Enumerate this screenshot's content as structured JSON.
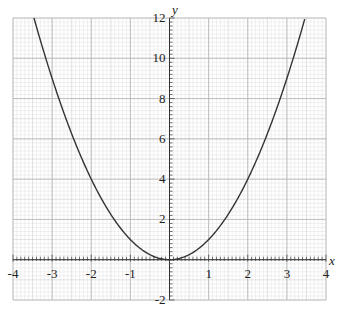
{
  "chart_data": {
    "type": "line",
    "title": "",
    "xlabel": "x",
    "ylabel": "y",
    "xlim": [
      -4,
      4
    ],
    "ylim": [
      -2,
      12
    ],
    "grid": true,
    "x_ticks": [
      -4,
      -3,
      -2,
      -1,
      1,
      2,
      3,
      4
    ],
    "y_ticks": [
      -2,
      2,
      4,
      6,
      8,
      10,
      12
    ],
    "series": [
      {
        "name": "y = x^2",
        "function": "x^2",
        "x": [
          -3.46,
          -3,
          -2.5,
          -2,
          -1.5,
          -1,
          -0.5,
          0,
          0.5,
          1,
          1.5,
          2,
          2.5,
          3,
          3.46
        ],
        "y": [
          12,
          9,
          6.25,
          4,
          2.25,
          1,
          0.25,
          0,
          0.25,
          1,
          2.25,
          4,
          6.25,
          9,
          12
        ],
        "color": "#333333"
      }
    ]
  },
  "labels": {
    "x_axis": "x",
    "y_axis": "y",
    "x_tick_labels": [
      "-4",
      "-3",
      "-2",
      "-1",
      "1",
      "2",
      "3",
      "4"
    ],
    "y_tick_labels": [
      "-2",
      "2",
      "4",
      "6",
      "8",
      "10",
      "12"
    ]
  }
}
